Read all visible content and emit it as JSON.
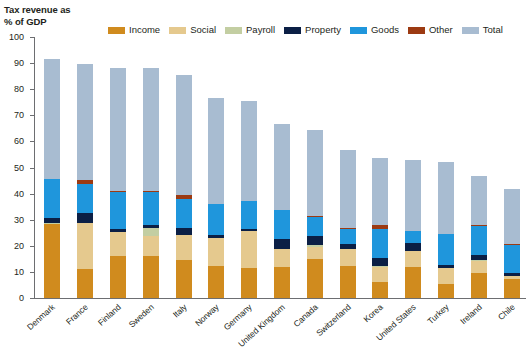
{
  "title": {
    "line1": "Tax revenue as",
    "line2": "% of GDP"
  },
  "legend": {
    "position": "top",
    "items": [
      {
        "label": "Income",
        "color": "#D08B1E"
      },
      {
        "label": "Social",
        "color": "#E5C98E"
      },
      {
        "label": "Payroll",
        "color": "#C3CEA2"
      },
      {
        "label": "Property",
        "color": "#0B1F45"
      },
      {
        "label": "Goods",
        "color": "#1F96DC"
      },
      {
        "label": "Other",
        "color": "#9C3A12"
      },
      {
        "label": "Total",
        "color": "#A8BCD1"
      }
    ]
  },
  "axis": {
    "y_label": "Tax revenue as % of GDP",
    "y_ticks": [
      "0",
      "10",
      "20",
      "30",
      "40",
      "50",
      "60",
      "70",
      "80",
      "90",
      "100"
    ],
    "y_min": 0,
    "y_max": 100,
    "grid": false
  },
  "chart_data": {
    "type": "bar",
    "subtype": "stacked-with-total-overlay",
    "title": "Tax revenue as % of GDP",
    "xlabel": "",
    "ylabel": "Tax revenue as % of GDP",
    "ylim": [
      0,
      100
    ],
    "categories": [
      "Denmark",
      "France",
      "Finland",
      "Sweden",
      "Italy",
      "Norway",
      "Germany",
      "United Kingdom",
      "Canada",
      "Switzerland",
      "Korea",
      "United States",
      "Turkey",
      "Ireland",
      "Chile"
    ],
    "series": [
      {
        "name": "Income",
        "color": "#D08B1E",
        "values": [
          28.7,
          11.1,
          16.0,
          16.1,
          14.4,
          12.1,
          11.5,
          12.0,
          14.8,
          12.4,
          6.0,
          12.0,
          5.2,
          9.7,
          7.2
        ]
      },
      {
        "name": "Social",
        "color": "#E5C98E",
        "values": [
          0.0,
          17.6,
          9.3,
          7.6,
          9.9,
          11.0,
          14.2,
          6.6,
          4.8,
          6.3,
          6.3,
          6.2,
          6.4,
          4.7,
          1.4
        ]
      },
      {
        "name": "Payroll",
        "color": "#C3CEA2",
        "values": [
          0.2,
          0.0,
          0.0,
          3.2,
          0.0,
          0.0,
          0.0,
          0.0,
          0.6,
          0.0,
          0.1,
          0.0,
          0.0,
          0.2,
          0.0
        ]
      },
      {
        "name": "Property",
        "color": "#0B1F45",
        "values": [
          1.8,
          3.9,
          1.2,
          1.0,
          2.4,
          1.2,
          0.9,
          4.1,
          3.4,
          1.9,
          2.9,
          2.9,
          1.2,
          1.9,
          0.9
        ]
      },
      {
        "name": "Goods",
        "color": "#1F96DC",
        "values": [
          15.0,
          11.0,
          14.2,
          13.1,
          11.2,
          11.6,
          10.6,
          10.9,
          7.5,
          6.0,
          11.2,
          4.4,
          11.7,
          11.4,
          11.1
        ]
      },
      {
        "name": "Other",
        "color": "#9C3A12",
        "values": [
          0.0,
          1.5,
          0.4,
          0.1,
          1.5,
          0.0,
          0.0,
          0.0,
          0.3,
          0.2,
          1.5,
          0.0,
          0.0,
          0.2,
          0.2
        ]
      },
      {
        "name": "Total",
        "color": "#A8BCD1",
        "values": [
          91.5,
          89.8,
          88.0,
          88.0,
          85.3,
          76.6,
          75.3,
          66.5,
          64.2,
          56.6,
          53.5,
          53.0,
          52.0,
          46.8,
          41.8
        ]
      }
    ],
    "note": "Each bar shows stacked tax-type components at the base and a lighter 'Total' column extending to the full bar height."
  }
}
